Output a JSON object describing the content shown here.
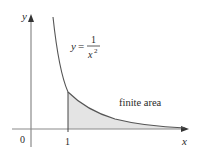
{
  "diagram": {
    "type": "function-area-plot",
    "function_label": {
      "lhs": "y",
      "equals": "=",
      "numerator": "1",
      "denominator_base": "x",
      "denominator_exp": "2"
    },
    "axes": {
      "x_label": "x",
      "y_label": "y",
      "origin_label": "0",
      "tick_label_x1": "1"
    },
    "region_label": "finite area",
    "colors": {
      "curve": "#555555",
      "axis": "#8a8a8a",
      "shade": "#e4e4e4",
      "text": "#2a2a2a"
    }
  }
}
